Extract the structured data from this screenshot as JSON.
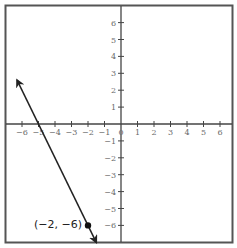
{
  "chart_data": {
    "type": "line",
    "title": "",
    "xlabel": "",
    "ylabel": "",
    "xlim": [
      -7,
      7
    ],
    "ylim": [
      -7,
      7
    ],
    "grid": false,
    "x_ticks": [
      -6,
      -5,
      -4,
      -3,
      -2,
      -1,
      0,
      1,
      2,
      3,
      4,
      5,
      6
    ],
    "y_ticks": [
      -6,
      -5,
      -4,
      -3,
      -2,
      -1,
      0,
      1,
      2,
      3,
      4,
      5,
      6
    ],
    "x_tick_labels": [
      "−6",
      "−5",
      "−4",
      "−3",
      "−2",
      "−1",
      "0",
      "1",
      "2",
      "3",
      "4",
      "5",
      "6"
    ],
    "y_tick_labels": [
      "−6",
      "−5",
      "−4",
      "−3",
      "−2",
      "−1",
      "0",
      "1",
      "2",
      "3",
      "4",
      "5",
      "6"
    ],
    "series": [
      {
        "name": "line",
        "style": "line with arrows at both ends",
        "equation": "y = -2x - 10",
        "x": [
          -6.3,
          -1.5
        ],
        "y": [
          2.6,
          -7.0
        ]
      }
    ],
    "points": [
      {
        "x": -2,
        "y": -6,
        "label": "(−2, −6)"
      }
    ],
    "colors": {
      "axis": "#444444",
      "line": "#222222",
      "frame": "#555555",
      "tick_text": "#6a6a6a"
    }
  }
}
